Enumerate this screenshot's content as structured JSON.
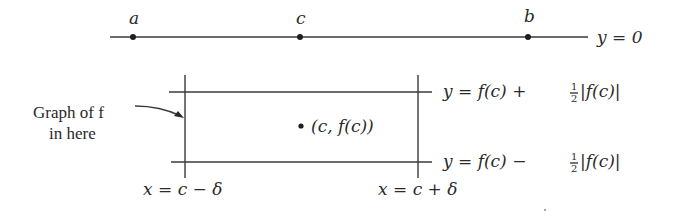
{
  "number_line": {
    "points": [
      {
        "name": "a",
        "label": "a"
      },
      {
        "name": "c",
        "label": "c"
      },
      {
        "name": "b",
        "label": "b"
      }
    ],
    "axis_label": "y = 0"
  },
  "box": {
    "upper_label_prefix": "y = f(c) + ",
    "lower_label_prefix": "y = f(c) − ",
    "fraction_num": "1",
    "fraction_den": "2",
    "abs_term": "|f(c)|",
    "left_label": "x = c − δ",
    "right_label": "x = c + δ",
    "center_point_label": "(c, f(c))"
  },
  "annotation": {
    "line1": "Graph of f",
    "line2": "in here"
  }
}
